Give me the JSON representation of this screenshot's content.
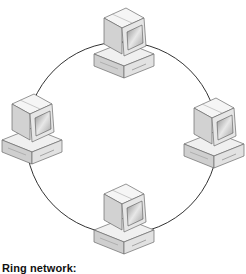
{
  "diagram": {
    "type": "ring-network-topology",
    "caption": "Ring network:",
    "ring": {
      "cx": 122,
      "cy": 138,
      "r": 96,
      "stroke": "#333333"
    },
    "nodes": [
      {
        "id": "computer-top",
        "label": "Computer",
        "x": 122,
        "y": 40
      },
      {
        "id": "computer-left",
        "label": "Computer",
        "x": 30,
        "y": 128
      },
      {
        "id": "computer-right",
        "label": "Computer",
        "x": 214,
        "y": 132
      },
      {
        "id": "computer-bottom",
        "label": "Computer",
        "x": 122,
        "y": 218
      }
    ],
    "colors": {
      "monitor_light": "#f2f2f2",
      "monitor_mid": "#d6d6d6",
      "monitor_dark": "#9a9a9a",
      "outline": "#6a6a6a",
      "screen": "#bdbdbd"
    }
  }
}
